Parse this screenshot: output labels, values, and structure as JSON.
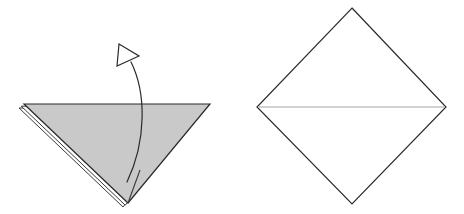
{
  "figure": {
    "background_color": "#ffffff",
    "width": 464,
    "height": 214,
    "panel_count": 2
  },
  "colors": {
    "paper_shaded": "#c9c9c9",
    "paper_white": "#ffffff",
    "edge_stroke": "#3a3a3a",
    "edge_stroke_dark": "#2b2b2b",
    "crease_stroke": "#c2c2c2",
    "arrow_stroke": "#2b2b2b"
  },
  "left_panel": {
    "name": "folded-triangle-panel",
    "shape": "downward-pointing-triangle",
    "state": "folded",
    "fill": "#c9c9c9",
    "vertices": [
      {
        "label": "top-left",
        "x": 24,
        "y": 104
      },
      {
        "label": "top-right",
        "x": 210,
        "y": 104
      },
      {
        "label": "bottom-apex",
        "x": 128,
        "y": 203
      }
    ],
    "layers": {
      "count": 2,
      "description": "second paper layer visible as thin offset sliver along lower-left edge",
      "offset_x": -5,
      "offset_y": 4
    },
    "inner_fold_line": {
      "from": {
        "x": 128,
        "y": 203
      },
      "to": {
        "x": 140,
        "y": 170
      }
    }
  },
  "arrow": {
    "name": "unfold-arrow",
    "type": "curved-open-arrow",
    "meaning": "unfold",
    "stroke": "#2b2b2b",
    "tail": {
      "x": 127,
      "y": 182
    },
    "tip": {
      "x": 131,
      "y": 62
    },
    "control_points": [
      {
        "x": 147,
        "y": 140
      },
      {
        "x": 146,
        "y": 92
      }
    ],
    "head": {
      "style": "open-outline-triangle",
      "fill": "#ffffff",
      "points": [
        {
          "x": 119,
          "y": 44
        },
        {
          "x": 139,
          "y": 56
        },
        {
          "x": 117,
          "y": 66
        }
      ]
    }
  },
  "right_panel": {
    "name": "unfolded-diamond-panel",
    "shape": "diamond",
    "state": "unfolded",
    "fill": "#ffffff",
    "vertices": [
      {
        "label": "top",
        "x": 352,
        "y": 8
      },
      {
        "label": "right",
        "x": 446,
        "y": 107
      },
      {
        "label": "bottom",
        "x": 352,
        "y": 204
      },
      {
        "label": "left",
        "x": 257,
        "y": 107
      }
    ],
    "crease": {
      "name": "horizontal-crease",
      "type": "fold-line",
      "color": "#c2c2c2",
      "from": {
        "x": 257,
        "y": 107
      },
      "to": {
        "x": 446,
        "y": 107
      }
    }
  }
}
